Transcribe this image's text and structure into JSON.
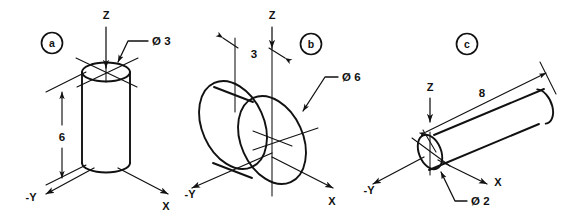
{
  "drawing": {
    "title": "Isometric cylinder views",
    "background_color": "#ffffff",
    "line_color": "#111111"
  },
  "figures": [
    {
      "tag": "a",
      "description": "vertical cylinder on Z axis",
      "axes": [
        {
          "name": "z-axis",
          "label": "Z"
        },
        {
          "name": "x-axis",
          "label": "X"
        },
        {
          "name": "negative-y-axis",
          "label": "-Y"
        }
      ],
      "dimensions": [
        {
          "name": "height-dimension",
          "label": "6"
        },
        {
          "name": "diameter-callout",
          "label": "Ø 3"
        }
      ]
    },
    {
      "tag": "b",
      "description": "disc along negative Y axis",
      "axes": [
        {
          "name": "z-axis",
          "label": "Z"
        },
        {
          "name": "x-axis",
          "label": "X"
        },
        {
          "name": "negative-y-axis",
          "label": "-Y"
        }
      ],
      "dimensions": [
        {
          "name": "thickness-dimension",
          "label": "3"
        },
        {
          "name": "diameter-callout",
          "label": "Ø 6"
        }
      ]
    },
    {
      "tag": "c",
      "description": "rod along X axis",
      "axes": [
        {
          "name": "z-axis",
          "label": "Z"
        },
        {
          "name": "x-axis",
          "label": "X"
        },
        {
          "name": "negative-y-axis",
          "label": "-Y"
        }
      ],
      "dimensions": [
        {
          "name": "length-dimension",
          "label": "8"
        },
        {
          "name": "diameter-callout",
          "label": "Ø 2"
        }
      ]
    }
  ]
}
